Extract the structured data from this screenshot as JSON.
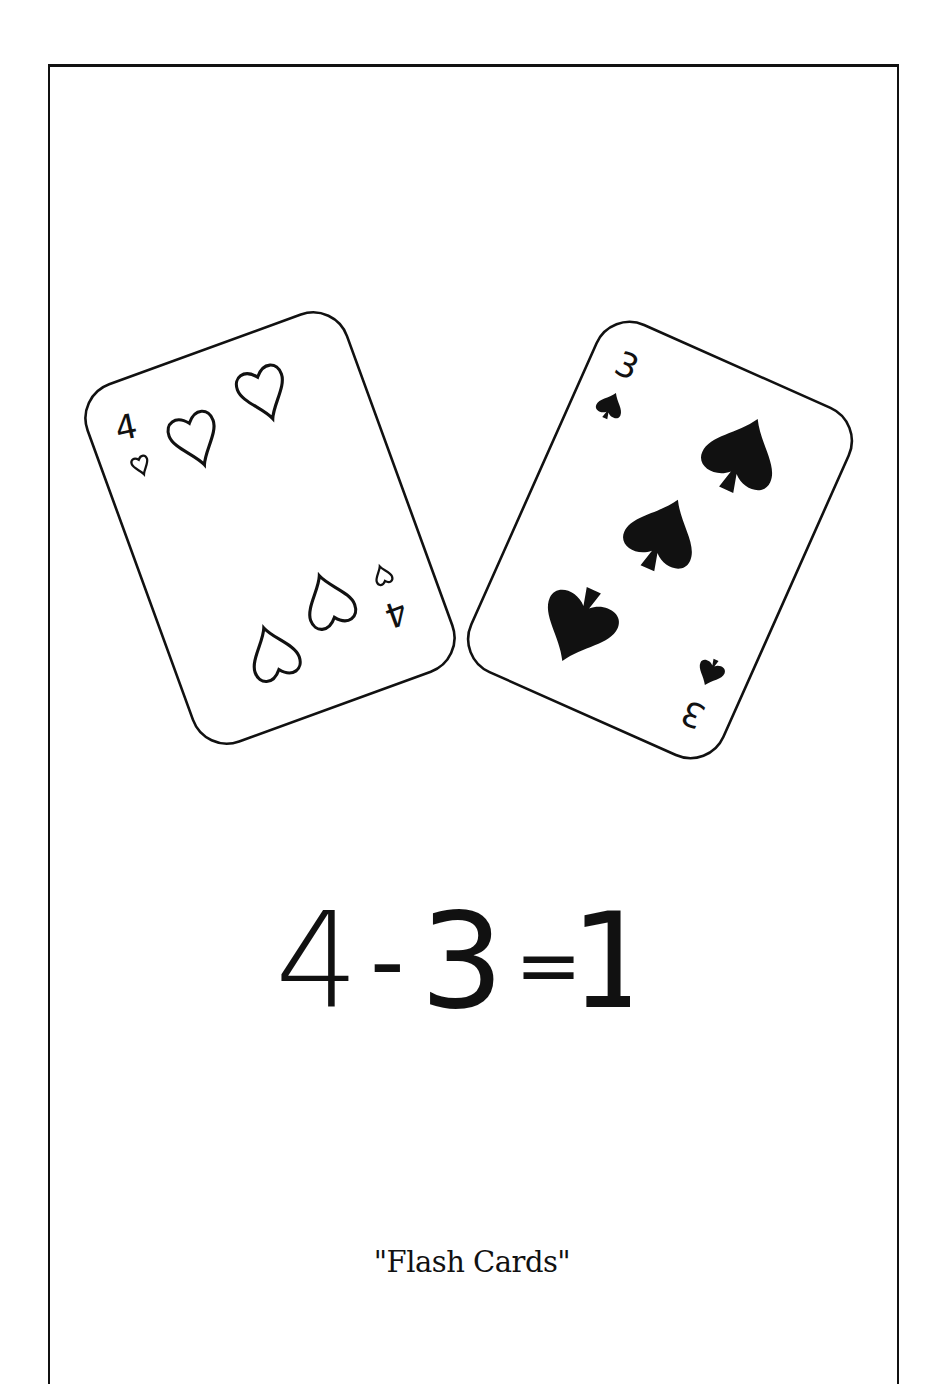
{
  "illustration": {
    "left_card": {
      "rank": "4",
      "suit": "hearts",
      "suit_icon": "heart-outline-icon",
      "pip_count": 4
    },
    "right_card": {
      "rank": "3",
      "suit": "spades",
      "suit_icon": "spade-filled-icon",
      "pip_count": 3
    }
  },
  "equation": {
    "operand_a": "4",
    "operator": "-",
    "operand_b": "3",
    "equals": "=",
    "result": "1"
  },
  "caption": "\"Flash Cards\"",
  "colors": {
    "ink": "#111111",
    "paper": "#ffffff"
  }
}
